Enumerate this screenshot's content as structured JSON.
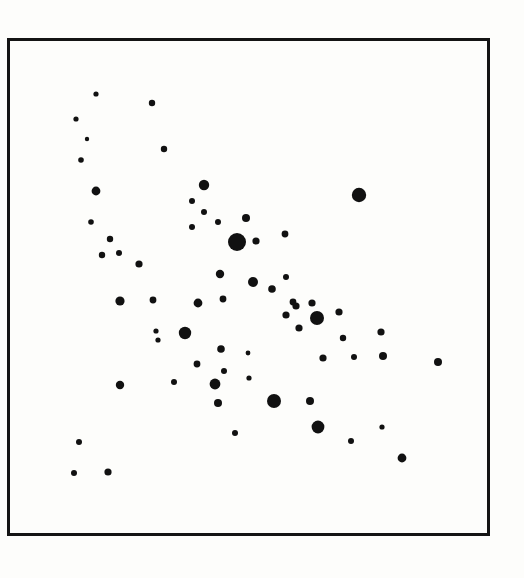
{
  "figure": {
    "kind": "scatter-plot",
    "caption": "",
    "background_color": "#fdfdfb",
    "ink_color": "#111111"
  },
  "frame": {
    "x": 7,
    "y": 38,
    "width": 483,
    "height": 498,
    "stroke_width": 3,
    "stroke_color": "#141414"
  },
  "chart_data": {
    "type": "scatter",
    "title": "",
    "subtitle": "",
    "xlabel": "",
    "ylabel": "",
    "xlim": [
      0,
      483
    ],
    "ylim": [
      0,
      498
    ],
    "grid": false,
    "axis_ticks": false,
    "legend": null,
    "point_count": 81,
    "marker_color": "#111111",
    "marker_shape": "filled-circle",
    "size_encoding": "marker radius in pixels (varies per point)",
    "series": [
      {
        "name": "points",
        "points": [
          {
            "x": 96,
            "y": 94,
            "r": 2.6
          },
          {
            "x": 152,
            "y": 103,
            "r": 3.2
          },
          {
            "x": 76,
            "y": 119,
            "r": 2.6
          },
          {
            "x": 87,
            "y": 139,
            "r": 2.2
          },
          {
            "x": 164,
            "y": 149,
            "r": 3.2
          },
          {
            "x": 81,
            "y": 160,
            "r": 2.8
          },
          {
            "x": 96,
            "y": 191,
            "r": 4.4
          },
          {
            "x": 204,
            "y": 185,
            "r": 5.2
          },
          {
            "x": 359,
            "y": 195,
            "r": 7.2
          },
          {
            "x": 192,
            "y": 201,
            "r": 3.0
          },
          {
            "x": 204,
            "y": 212,
            "r": 3.0
          },
          {
            "x": 218,
            "y": 222,
            "r": 3.0
          },
          {
            "x": 246,
            "y": 218,
            "r": 4.0
          },
          {
            "x": 91,
            "y": 222,
            "r": 2.8
          },
          {
            "x": 192,
            "y": 227,
            "r": 3.0
          },
          {
            "x": 285,
            "y": 234,
            "r": 3.4
          },
          {
            "x": 237,
            "y": 242,
            "r": 9.0
          },
          {
            "x": 256,
            "y": 241,
            "r": 3.6
          },
          {
            "x": 110,
            "y": 239,
            "r": 3.2
          },
          {
            "x": 102,
            "y": 255,
            "r": 3.2
          },
          {
            "x": 119,
            "y": 253,
            "r": 3.0
          },
          {
            "x": 139,
            "y": 264,
            "r": 3.6
          },
          {
            "x": 220,
            "y": 274,
            "r": 4.2
          },
          {
            "x": 253,
            "y": 282,
            "r": 5.0
          },
          {
            "x": 286,
            "y": 277,
            "r": 3.0
          },
          {
            "x": 272,
            "y": 289,
            "r": 3.8
          },
          {
            "x": 120,
            "y": 301,
            "r": 4.6
          },
          {
            "x": 153,
            "y": 300,
            "r": 3.4
          },
          {
            "x": 198,
            "y": 303,
            "r": 4.4
          },
          {
            "x": 223,
            "y": 299,
            "r": 3.4
          },
          {
            "x": 293,
            "y": 302,
            "r": 3.4
          },
          {
            "x": 296,
            "y": 306,
            "r": 3.6
          },
          {
            "x": 312,
            "y": 303,
            "r": 3.6
          },
          {
            "x": 286,
            "y": 315,
            "r": 3.6
          },
          {
            "x": 317,
            "y": 318,
            "r": 7.0
          },
          {
            "x": 339,
            "y": 312,
            "r": 3.6
          },
          {
            "x": 299,
            "y": 328,
            "r": 3.6
          },
          {
            "x": 185,
            "y": 333,
            "r": 6.2
          },
          {
            "x": 156,
            "y": 331,
            "r": 2.6
          },
          {
            "x": 158,
            "y": 340,
            "r": 2.6
          },
          {
            "x": 381,
            "y": 332,
            "r": 3.6
          },
          {
            "x": 221,
            "y": 349,
            "r": 3.8
          },
          {
            "x": 248,
            "y": 353,
            "r": 2.4
          },
          {
            "x": 343,
            "y": 338,
            "r": 3.2
          },
          {
            "x": 383,
            "y": 356,
            "r": 4.0
          },
          {
            "x": 323,
            "y": 358,
            "r": 3.6
          },
          {
            "x": 354,
            "y": 357,
            "r": 3.0
          },
          {
            "x": 438,
            "y": 362,
            "r": 4.0
          },
          {
            "x": 197,
            "y": 364,
            "r": 3.4
          },
          {
            "x": 224,
            "y": 371,
            "r": 3.0
          },
          {
            "x": 174,
            "y": 382,
            "r": 3.0
          },
          {
            "x": 120,
            "y": 385,
            "r": 4.2
          },
          {
            "x": 215,
            "y": 384,
            "r": 5.4
          },
          {
            "x": 249,
            "y": 378,
            "r": 2.6
          },
          {
            "x": 218,
            "y": 403,
            "r": 4.0
          },
          {
            "x": 274,
            "y": 401,
            "r": 7.0
          },
          {
            "x": 310,
            "y": 401,
            "r": 4.0
          },
          {
            "x": 318,
            "y": 427,
            "r": 6.4
          },
          {
            "x": 382,
            "y": 427,
            "r": 2.6
          },
          {
            "x": 235,
            "y": 433,
            "r": 3.0
          },
          {
            "x": 351,
            "y": 441,
            "r": 3.0
          },
          {
            "x": 79,
            "y": 442,
            "r": 3.0
          },
          {
            "x": 402,
            "y": 458,
            "r": 4.4
          },
          {
            "x": 74,
            "y": 473,
            "r": 3.0
          },
          {
            "x": 108,
            "y": 472,
            "r": 3.6
          }
        ]
      }
    ]
  }
}
